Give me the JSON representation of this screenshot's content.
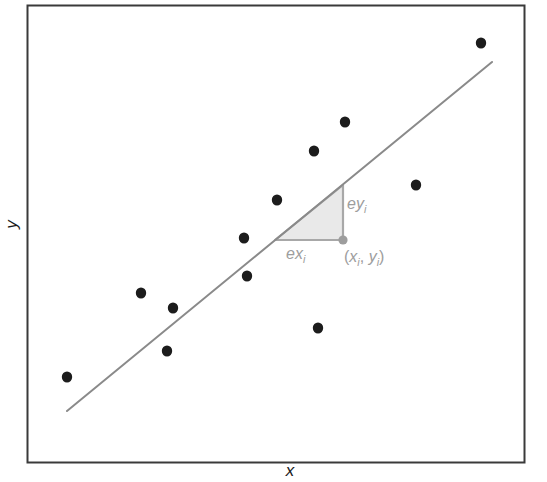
{
  "figure": {
    "kind": "scatter-with-regression-line",
    "axes": {
      "xlabel": "x",
      "ylabel": "y"
    },
    "annotations": {
      "ey_label": "ey",
      "ey_sub": "i",
      "ex_label": "ex",
      "ex_sub": "i",
      "point_open": "(",
      "point_x": "x",
      "point_x_sub": "i",
      "point_sep": ", ",
      "point_y": "y",
      "point_y_sub": "i",
      "point_close": ")"
    },
    "colors": {
      "frame": "#3a3a3a",
      "background": "#ffffff",
      "line": "#8a8a8a",
      "point": "#1c1c1c",
      "triangle_fill": "#e9e9e9",
      "triangle_stroke": "#a8a8a8",
      "annotation_text": "#9d9d9d",
      "axis_text": "#1a1a1a",
      "marker_point": "#9d9d9d"
    }
  },
  "chart_data": {
    "type": "scatter",
    "title": "",
    "xlabel": "x",
    "ylabel": "y",
    "grid": false,
    "legend": false,
    "axis_ticks": [],
    "xlim": [
      27,
      525
    ],
    "ylim": [
      463,
      5
    ],
    "note": "Coordinates are given in screenshot pixel space; y increases downward.",
    "points": [
      {
        "x": 67,
        "y": 377
      },
      {
        "x": 141,
        "y": 293
      },
      {
        "x": 167,
        "y": 351
      },
      {
        "x": 173,
        "y": 308
      },
      {
        "x": 244,
        "y": 238
      },
      {
        "x": 247,
        "y": 276
      },
      {
        "x": 277,
        "y": 200
      },
      {
        "x": 314,
        "y": 151
      },
      {
        "x": 318,
        "y": 328
      },
      {
        "x": 345,
        "y": 122
      },
      {
        "x": 416,
        "y": 185
      },
      {
        "x": 481,
        "y": 43
      },
      {
        "x": 343,
        "y": 240
      }
    ],
    "regression_line": {
      "x1": 67,
      "y1": 411,
      "x2": 492,
      "y2": 62
    },
    "error_triangle": {
      "vertex_left": {
        "x": 275,
        "y": 240
      },
      "vertex_right": {
        "x": 343,
        "y": 240
      },
      "vertex_top": {
        "x": 343,
        "y": 185
      }
    },
    "highlighted_point": {
      "x": 343,
      "y": 240
    }
  }
}
